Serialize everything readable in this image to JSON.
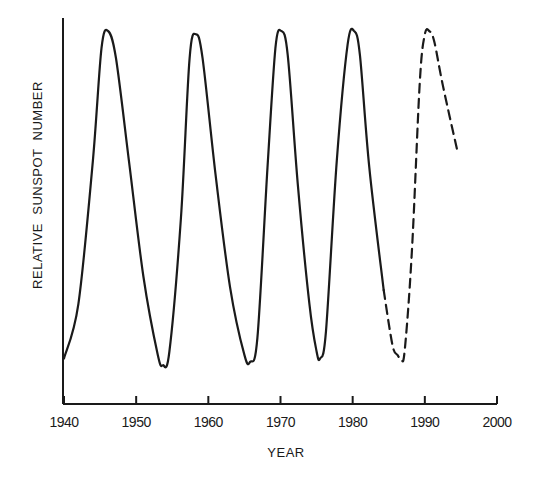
{
  "chart_data": {
    "type": "line",
    "title": "",
    "xlabel": "YEAR",
    "ylabel": "RELATIVE  SUNSPOT  NUMBER",
    "xlim": [
      1940,
      2000
    ],
    "ylim": [
      0,
      100
    ],
    "x_ticks": [
      1940,
      1950,
      1960,
      1970,
      1980,
      1990,
      2000
    ],
    "x_tick_labels": [
      "1940",
      "1950",
      "1960",
      "1970",
      "1980",
      "1990",
      "2000"
    ],
    "y_ticks": [],
    "grid": false,
    "legend": null,
    "series": [
      {
        "name": "Observed",
        "style": "solid",
        "x": [
          1940.0,
          1942.0,
          1944.0,
          1945.2,
          1946.1,
          1947.2,
          1949.0,
          1951.0,
          1953.0,
          1953.7,
          1954.6,
          1956.2,
          1957.4,
          1958.3,
          1959.2,
          1961.0,
          1963.0,
          1965.0,
          1965.8,
          1966.8,
          1968.2,
          1969.3,
          1970.1,
          1971.0,
          1972.4,
          1974.0,
          1975.0,
          1975.5,
          1976.3,
          1977.8,
          1979.3,
          1980.2,
          1981.0,
          1982.3,
          1984.3
        ],
        "values": [
          4,
          20,
          62,
          95,
          100,
          92,
          62,
          28,
          5,
          2,
          6,
          45,
          92,
          99,
          92,
          58,
          25,
          5,
          3,
          10,
          60,
          95,
          100,
          93,
          55,
          20,
          6,
          4,
          12,
          62,
          96,
          100,
          93,
          60,
          24
        ]
      },
      {
        "name": "Predicted",
        "style": "dashed",
        "x": [
          1984.3,
          1985.5,
          1986.2,
          1986.7,
          1987.2,
          1988.2,
          1989.3,
          1990.0,
          1990.6,
          1991.3,
          1992.5,
          1994.6
        ],
        "values": [
          24,
          8,
          5,
          4,
          6,
          35,
          85,
          99,
          100,
          97,
          84,
          64
        ]
      }
    ]
  }
}
